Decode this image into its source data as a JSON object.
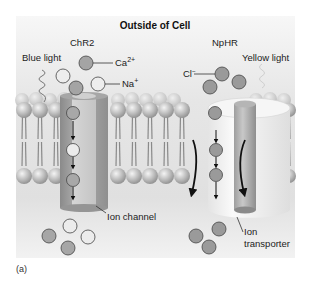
{
  "figure": {
    "title": "Outside of Cell",
    "caption": "(a)",
    "left_protein": {
      "name": "ChR2",
      "light_label": "Blue light",
      "ion_labels": {
        "calcium": "Ca",
        "calcium_sup": "2+",
        "sodium": "Na",
        "sodium_sup": "+"
      },
      "structure_label": "Ion channel"
    },
    "right_protein": {
      "name": "NpHR",
      "light_label": "Yellow light",
      "ion_labels": {
        "chloride": "Cl",
        "chloride_sup": "−"
      },
      "structure_label_line1": "Ion",
      "structure_label_line2": "transporter"
    },
    "colors": {
      "panel_top": "#f4f4f4",
      "panel_mid": "#e2e2e2",
      "membrane_head": "#b8b8b8",
      "dark_ion": "#9a9a9a",
      "light_ion": "#ececec",
      "channel": "#9c9c9c",
      "transporter": "#ededed"
    }
  }
}
